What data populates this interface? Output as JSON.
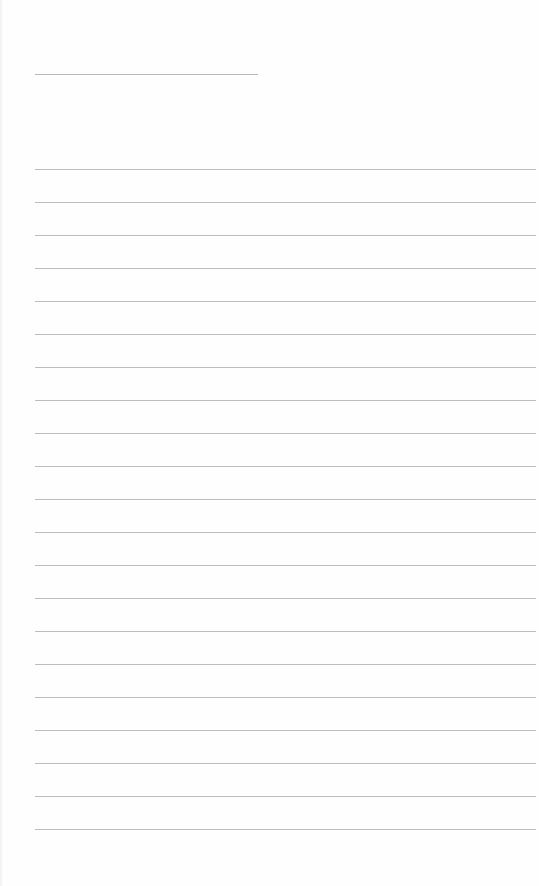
{
  "page": {
    "type": "lined-paper",
    "background_color": "#fefefe",
    "line_color": "#bdbdbd",
    "title_line": {
      "x": 35,
      "y": 74,
      "width": 223
    },
    "rules": {
      "start_y": 169,
      "spacing": 33,
      "count": 21,
      "x": 35,
      "width": 501
    },
    "text": []
  }
}
